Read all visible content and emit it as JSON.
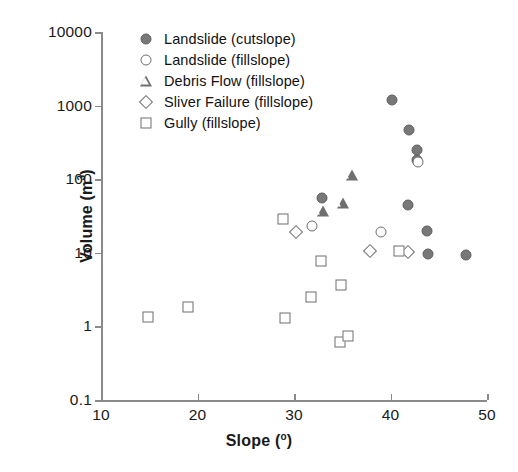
{
  "chart_data": {
    "type": "scatter",
    "title": "",
    "xlabel": "Slope (°)",
    "ylabel": "Volume (m³)",
    "xlabel_text": "Slope (",
    "xlabel_unit": "o",
    "xlabel_tail": ")",
    "ylabel_text": "Volume (m",
    "ylabel_sup": "3",
    "ylabel_tail": ")",
    "xlim": [
      10,
      50
    ],
    "ylim": [
      0.1,
      10000
    ],
    "yscale": "log",
    "xscale": "linear",
    "grid": false,
    "legend_position": "top-left inside",
    "xticks": [
      10,
      20,
      30,
      40,
      50
    ],
    "xtick_labels": [
      "10",
      "20",
      "30",
      "40",
      "50"
    ],
    "yticks": [
      0.1,
      1,
      10,
      100,
      1000,
      10000
    ],
    "ytick_labels": [
      "0.1",
      "1",
      "10",
      "100",
      "1000",
      "10000"
    ],
    "series": [
      {
        "name": "Landslide (cutslope)",
        "marker": "circle-filled",
        "color": "#787878",
        "points": [
          {
            "x": 40.2,
            "y": 1200
          },
          {
            "x": 41.9,
            "y": 470
          },
          {
            "x": 42.7,
            "y": 250
          },
          {
            "x": 42.7,
            "y": 180
          },
          {
            "x": 32.9,
            "y": 55
          },
          {
            "x": 41.8,
            "y": 45
          },
          {
            "x": 43.8,
            "y": 20
          },
          {
            "x": 43.9,
            "y": 9.7
          },
          {
            "x": 47.8,
            "y": 9.2
          }
        ]
      },
      {
        "name": "Landslide (fillslope)",
        "marker": "circle-open",
        "color": "#6e6e6e",
        "points": [
          {
            "x": 31.9,
            "y": 23
          },
          {
            "x": 39.0,
            "y": 19
          },
          {
            "x": 42.8,
            "y": 170
          }
        ]
      },
      {
        "name": "Debris Flow (fillslope)",
        "marker": "triangle-open",
        "color": "#6e6e6e",
        "points": [
          {
            "x": 36.0,
            "y": 115
          },
          {
            "x": 35.1,
            "y": 48
          },
          {
            "x": 33.0,
            "y": 37
          }
        ]
      },
      {
        "name": "Sliver Failure (fillslope)",
        "marker": "diamond-open",
        "color": "#6e6e6e",
        "points": [
          {
            "x": 30.2,
            "y": 19
          },
          {
            "x": 37.9,
            "y": 10.5
          },
          {
            "x": 41.8,
            "y": 10.2
          }
        ]
      },
      {
        "name": "Gully (fillslope)",
        "marker": "square-open",
        "color": "#6e6e6e",
        "points": [
          {
            "x": 14.9,
            "y": 1.35
          },
          {
            "x": 19.0,
            "y": 1.85
          },
          {
            "x": 28.9,
            "y": 29
          },
          {
            "x": 29.1,
            "y": 1.3
          },
          {
            "x": 31.8,
            "y": 2.5
          },
          {
            "x": 32.8,
            "y": 7.8
          },
          {
            "x": 34.9,
            "y": 3.6
          },
          {
            "x": 34.8,
            "y": 0.62
          },
          {
            "x": 35.6,
            "y": 0.74
          },
          {
            "x": 40.9,
            "y": 10.6
          }
        ]
      }
    ]
  },
  "legend": {
    "entries": [
      {
        "label": "Landslide (cutslope)",
        "marker": "circle-filled"
      },
      {
        "label": "Landslide (fillslope)",
        "marker": "circle-open"
      },
      {
        "label": "Debris Flow (fillslope)",
        "marker": "triangle-open"
      },
      {
        "label": "Sliver Failure (fillslope)",
        "marker": "diamond-open"
      },
      {
        "label": "Gully (fillslope)",
        "marker": "square-open"
      }
    ]
  }
}
